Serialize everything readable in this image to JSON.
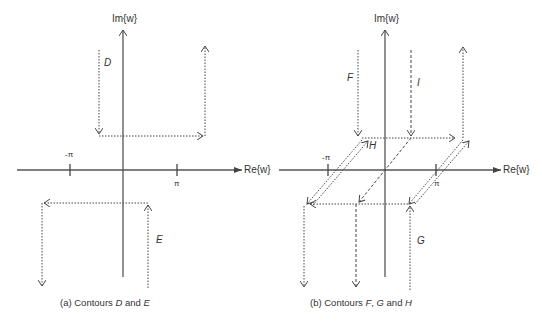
{
  "panels": [
    {
      "id": "a",
      "caption_prefix": "(a) Contours ",
      "caption_c1": "D",
      "caption_mid": " and ",
      "caption_c2": "E",
      "im_label": "Im{w}",
      "re_label": "Re{w}",
      "tick_neg": "-π",
      "tick_pos": "π",
      "contour_labels": {
        "D": "D",
        "E": "E"
      }
    },
    {
      "id": "b",
      "caption_prefix": "(b) Contours ",
      "caption_c1": "F",
      "caption_sep": ", ",
      "caption_c2": "G",
      "caption_mid": " and ",
      "caption_c3": "H",
      "im_label": "Im{w}",
      "re_label": "Re{w}",
      "tick_neg": "-π",
      "tick_pos": "π",
      "contour_labels": {
        "F": "F",
        "G": "G",
        "H": "H",
        "I": "I"
      }
    }
  ],
  "colors": {
    "axis": "#555555",
    "contour": "#444444",
    "text": "#333333"
  }
}
